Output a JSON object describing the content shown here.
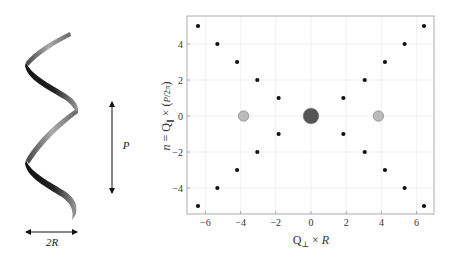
{
  "figure": {
    "left_panel": {
      "title": "helix schematic",
      "radius_label": "2R",
      "pitch_label": "P"
    }
  },
  "chart_data": {
    "type": "scatter",
    "title": "",
    "xlabel": "Q⊥ × R",
    "ylabel": "n = Q∥ × (P / 2π)",
    "xlim": [
      -7,
      7
    ],
    "ylim": [
      -5.5,
      5.5
    ],
    "xticks": [
      -6,
      -4,
      -2,
      0,
      2,
      4,
      6
    ],
    "yticks": [
      -4,
      -2,
      0,
      2,
      4
    ],
    "grid": true,
    "legend": null,
    "series": [
      {
        "name": "layer-line maxima",
        "color": "#111111",
        "marker_size": "small",
        "points": [
          {
            "x": -6.42,
            "y": 5
          },
          {
            "x": 6.42,
            "y": 5
          },
          {
            "x": -5.32,
            "y": 4
          },
          {
            "x": 5.32,
            "y": 4
          },
          {
            "x": -4.2,
            "y": 3
          },
          {
            "x": 4.2,
            "y": 3
          },
          {
            "x": -3.05,
            "y": 2
          },
          {
            "x": 3.05,
            "y": 2
          },
          {
            "x": -1.84,
            "y": 1
          },
          {
            "x": 1.84,
            "y": 1
          },
          {
            "x": -1.84,
            "y": -1
          },
          {
            "x": 1.84,
            "y": -1
          },
          {
            "x": -3.05,
            "y": -2
          },
          {
            "x": 3.05,
            "y": -2
          },
          {
            "x": -4.2,
            "y": -3
          },
          {
            "x": 4.2,
            "y": -3
          },
          {
            "x": -5.32,
            "y": -4
          },
          {
            "x": 5.32,
            "y": -4
          },
          {
            "x": -6.42,
            "y": -5
          },
          {
            "x": 6.42,
            "y": -5
          }
        ]
      },
      {
        "name": "equator secondary maxima",
        "color": "#bbbbbb",
        "marker_size": "medium",
        "points": [
          {
            "x": -3.83,
            "y": 0
          },
          {
            "x": 3.83,
            "y": 0
          }
        ]
      },
      {
        "name": "central maximum",
        "color": "#555555",
        "marker_size": "large",
        "points": [
          {
            "x": 0,
            "y": 0
          }
        ]
      }
    ]
  },
  "colors": {
    "axis": "#999999",
    "grid": "#eeeeee",
    "text": "#333333"
  }
}
